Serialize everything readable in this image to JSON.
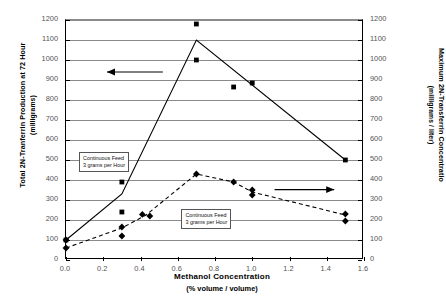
{
  "chart_data": {
    "type": "line",
    "title": "",
    "xlabel": "Methanol Concentration",
    "xlabel_sub": "(% volume / volume)",
    "ylabel_left": "Total 2N-Tranferrin Production at 72 Hour",
    "ylabel_left_sub": "(milligrams)",
    "ylabel_right": "Maximum 2N-Transferrin Concentratio",
    "ylabel_right_sub": "(milligrams / liter)",
    "xlim": [
      0.0,
      1.6
    ],
    "ylim_left": [
      0,
      1200
    ],
    "ylim_right": [
      0,
      1200
    ],
    "xticks": [
      "0.0",
      "0.2",
      "0.4",
      "0.6",
      "0.8",
      "1.0",
      "1.2",
      "1.4",
      "1.6"
    ],
    "xtick_values": [
      0.0,
      0.2,
      0.4,
      0.6,
      0.8,
      1.0,
      1.2,
      1.4,
      1.6
    ],
    "yticks": [
      "0",
      "100",
      "200",
      "300",
      "400",
      "500",
      "600",
      "700",
      "800",
      "900",
      "1000",
      "1100",
      "1200"
    ],
    "ytick_values": [
      0,
      100,
      200,
      300,
      400,
      500,
      600,
      700,
      800,
      900,
      1000,
      1100,
      1200
    ],
    "grid": true,
    "legend": "none",
    "series": [
      {
        "name": "Total 2N-Tranferrin Production at 72 Hour",
        "axis": "left",
        "marker": "square",
        "linestyle": "solid",
        "color": "#000000",
        "line_points": [
          {
            "x": 0.0,
            "y": 100
          },
          {
            "x": 0.3,
            "y": 330
          },
          {
            "x": 0.7,
            "y": 1100
          },
          {
            "x": 1.5,
            "y": 500
          }
        ],
        "markers": [
          {
            "x": 0.0,
            "y": 100
          },
          {
            "x": 0.3,
            "y": 390
          },
          {
            "x": 0.3,
            "y": 240
          },
          {
            "x": 0.7,
            "y": 1180
          },
          {
            "x": 0.7,
            "y": 1000
          },
          {
            "x": 0.9,
            "y": 865
          },
          {
            "x": 1.0,
            "y": 885
          },
          {
            "x": 1.5,
            "y": 500
          }
        ]
      },
      {
        "name": "Maximum 2N-Transferrin Concentration",
        "axis": "right",
        "marker": "diamond",
        "linestyle": "dashed",
        "color": "#000000",
        "line_points": [
          {
            "x": 0.0,
            "y": 60
          },
          {
            "x": 0.3,
            "y": 160
          },
          {
            "x": 0.43,
            "y": 225
          },
          {
            "x": 0.7,
            "y": 430
          },
          {
            "x": 0.9,
            "y": 390
          },
          {
            "x": 1.0,
            "y": 340
          },
          {
            "x": 1.5,
            "y": 225
          }
        ],
        "markers": [
          {
            "x": 0.0,
            "y": 100
          },
          {
            "x": 0.0,
            "y": 60
          },
          {
            "x": 0.3,
            "y": 165
          },
          {
            "x": 0.3,
            "y": 120
          },
          {
            "x": 0.41,
            "y": 228
          },
          {
            "x": 0.45,
            "y": 220
          },
          {
            "x": 0.7,
            "y": 430
          },
          {
            "x": 0.9,
            "y": 390
          },
          {
            "x": 1.0,
            "y": 350
          },
          {
            "x": 1.0,
            "y": 325
          },
          {
            "x": 1.5,
            "y": 230
          },
          {
            "x": 1.5,
            "y": 195
          }
        ]
      }
    ],
    "annotations": [
      {
        "id": "callout-left",
        "line1": "Continuous Feed",
        "line2": "3 grams per Hour",
        "x": 0.07,
        "y": 500,
        "axis": "left"
      },
      {
        "id": "callout-right",
        "line1": "Continuous Feed",
        "line2": "3 grams per Hour",
        "x": 0.62,
        "y": 215,
        "axis": "right"
      },
      {
        "id": "arrow-to-left-axis",
        "direction": "left",
        "x_from": 0.52,
        "x_to": 0.22,
        "y": 940,
        "axis": "left"
      },
      {
        "id": "arrow-to-right-axis",
        "direction": "right",
        "x_from": 1.12,
        "x_to": 1.44,
        "y": 352,
        "axis": "right"
      }
    ]
  }
}
